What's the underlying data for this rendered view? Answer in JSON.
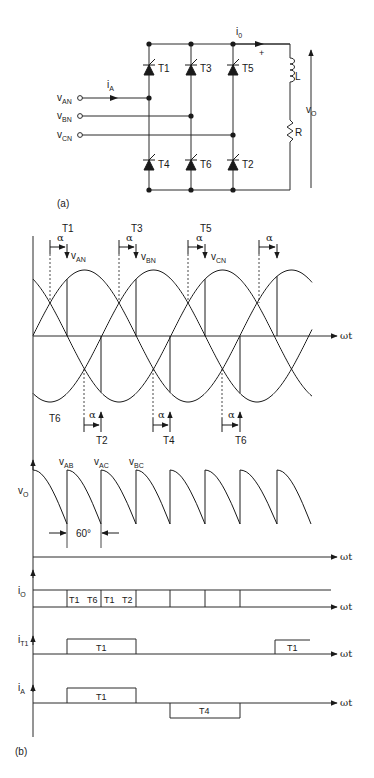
{
  "circuit": {
    "label": "(a)",
    "inputs": [
      {
        "name": "v",
        "sub": "AN"
      },
      {
        "name": "v",
        "sub": "BN"
      },
      {
        "name": "v",
        "sub": "CN"
      }
    ],
    "input_current": {
      "name": "i",
      "sub": "A"
    },
    "output_current": {
      "name": "i",
      "sub": "0"
    },
    "thyristors_top": [
      "T1",
      "T3",
      "T5"
    ],
    "thyristors_bottom": [
      "T4",
      "T6",
      "T2"
    ],
    "load": {
      "inductor": "L",
      "resistor": "R",
      "plus": "+"
    },
    "output_voltage": {
      "name": "v",
      "sub": "O"
    }
  },
  "waveforms": {
    "label": "(b)",
    "axis_label": "ωt",
    "alpha": "α",
    "upper_triggers": [
      {
        "thyristor": "T1",
        "phase": "v",
        "sub": "AN"
      },
      {
        "thyristor": "T3",
        "phase": "v",
        "sub": "BN"
      },
      {
        "thyristor": "T5",
        "phase": "v",
        "sub": "CN"
      },
      {
        "thyristor": "",
        "phase": "",
        "sub": ""
      }
    ],
    "lower_triggers": [
      "T2",
      "T4",
      "T6"
    ],
    "lower_start_label": "T6",
    "vo": {
      "name": "v",
      "sub": "O",
      "segments": [
        {
          "name": "v",
          "sub": "AB"
        },
        {
          "name": "v",
          "sub": "AC"
        },
        {
          "name": "v",
          "sub": "BC"
        }
      ],
      "interval": "60°"
    },
    "io": {
      "name": "i",
      "sub": "O",
      "cells": [
        "T1",
        "T6",
        "T1",
        "T2"
      ]
    },
    "iT1": {
      "name": "i",
      "sub": "T1",
      "pulses": [
        "T1",
        "T1"
      ]
    },
    "iA": {
      "name": "i",
      "sub": "A",
      "pulses": [
        "T1",
        "T4"
      ]
    }
  },
  "chart_data": {
    "type": "line",
    "xlabel": "ωt",
    "series": [
      {
        "name": "v_AN",
        "description": "upper phase sinusoid, fired by T1 at α after crossing"
      },
      {
        "name": "v_BN",
        "description": "phase shifted 120°, fired by T3"
      },
      {
        "name": "v_CN",
        "description": "phase shifted 240°, fired by T5"
      },
      {
        "name": "v_O",
        "description": "six-pulse output, segments v_AB, v_AC, v_BC, 60° interval"
      },
      {
        "name": "i_O",
        "description": "constant DC output current; conducting pairs T1 T6, T1 T2"
      },
      {
        "name": "i_T1",
        "description": "120° rectangular pulses"
      },
      {
        "name": "i_A",
        "description": "+120° (T1), zero 60°, −120° (T4)"
      }
    ],
    "annotations": [
      "α",
      "T1",
      "T3",
      "T5",
      "T2",
      "T4",
      "T6",
      "60°"
    ]
  }
}
